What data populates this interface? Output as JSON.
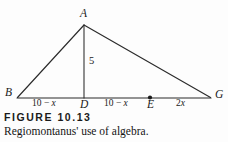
{
  "figure": {
    "number_label": "FIGURE 10.13",
    "caption": "Regiomontanus' use of algebra.",
    "background_color": "#fdfdfd",
    "ink_color": "#1a1a1a"
  },
  "diagram": {
    "type": "geometry-triangle",
    "vertices": [
      {
        "id": "A",
        "label": "A",
        "x": 84,
        "y": 25,
        "role": "apex"
      },
      {
        "id": "B",
        "label": "B",
        "x": 17,
        "y": 98,
        "role": "base-left"
      },
      {
        "id": "G",
        "label": "G",
        "x": 211,
        "y": 98,
        "role": "base-right"
      },
      {
        "id": "D",
        "label": "D",
        "x": 84,
        "y": 98,
        "role": "altitude-foot"
      },
      {
        "id": "E",
        "label": "E",
        "x": 150,
        "y": 98,
        "role": "base-point"
      }
    ],
    "edges": [
      {
        "from": "B",
        "to": "A"
      },
      {
        "from": "A",
        "to": "G"
      },
      {
        "from": "B",
        "to": "G"
      },
      {
        "from": "A",
        "to": "D",
        "style": "altitude"
      }
    ],
    "markers": [
      {
        "at": "E",
        "shape": "filled-dot"
      }
    ],
    "segment_labels": [
      {
        "id": "BD",
        "prefix": "10 − ",
        "variable": "x",
        "text": "10 − x",
        "x": 50,
        "y": 104
      },
      {
        "id": "DE",
        "prefix": "10 − ",
        "variable": "x",
        "text": "10 − x",
        "x": 121,
        "y": 104
      },
      {
        "id": "EG",
        "prefix": "2",
        "variable": "x",
        "text": "2x",
        "x": 181,
        "y": 104
      }
    ],
    "altitude_label": {
      "id": "AD",
      "text": "5",
      "x": 89,
      "y": 62
    }
  }
}
